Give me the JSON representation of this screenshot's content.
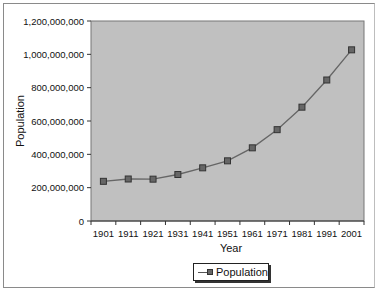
{
  "chart_data": {
    "type": "line",
    "title": "",
    "xlabel": "Year",
    "ylabel": "Population",
    "x": [
      "1901",
      "1911",
      "1921",
      "1931",
      "1941",
      "1951",
      "1961",
      "1971",
      "1981",
      "1991",
      "2001"
    ],
    "series": [
      {
        "name": "Population",
        "values": [
          238000000,
          252000000,
          251000000,
          279000000,
          319000000,
          361000000,
          439000000,
          548000000,
          683000000,
          846000000,
          1027000000
        ],
        "color": "#666666",
        "marker": "square"
      }
    ],
    "ylim": [
      0,
      1200000000
    ],
    "yticks": [
      "0",
      "200,000,000",
      "400,000,000",
      "600,000,000",
      "800,000,000",
      "1,000,000,000",
      "1,200,000,000"
    ],
    "grid": false,
    "plot_background": "#c0c0c0",
    "legend_position": "bottom"
  },
  "legend": {
    "label": "Population"
  },
  "axes": {
    "x_title": "Year",
    "y_title": "Population"
  }
}
